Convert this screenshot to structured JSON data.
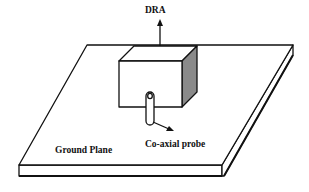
{
  "diagram": {
    "type": "schematic",
    "labels": {
      "dra": "DRA",
      "probe": "Co-axial probe",
      "ground_plane": "Ground Plane"
    },
    "components": [
      {
        "id": "ground-plane",
        "label": "Ground Plane",
        "shape": "parallelogram slab"
      },
      {
        "id": "dra-block",
        "label": "DRA",
        "shape": "rectangular block (cuboid)"
      },
      {
        "id": "coaxial-probe",
        "label": "Co-axial probe",
        "shape": "vertical cylinder"
      }
    ],
    "colors": {
      "line": "#111111",
      "fill": "#ffffff",
      "shade": "#8a8a8a"
    }
  }
}
